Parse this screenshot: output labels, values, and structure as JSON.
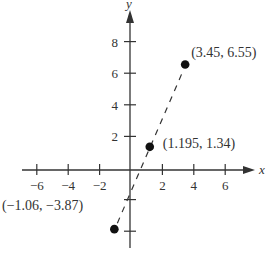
{
  "chart_data": {
    "type": "scatter",
    "title": "",
    "xlabel": "x",
    "ylabel": "y",
    "xlim": [
      -7,
      7.8
    ],
    "ylim": [
      -5,
      10
    ],
    "grid": false,
    "x_ticks": [
      -6,
      -4,
      -2,
      2,
      4,
      6
    ],
    "y_ticks": [
      -4,
      -2,
      2,
      4,
      6,
      8
    ],
    "y_tick_labels": [
      "",
      "",
      "2",
      "4",
      "6",
      "8"
    ],
    "x_tick_labels": [
      "−6",
      "−4",
      "−2",
      "2",
      "4",
      "6"
    ],
    "points": [
      {
        "x": -1.06,
        "y": -3.87,
        "label": "(−1.06, −3.87)"
      },
      {
        "x": 1.195,
        "y": 1.34,
        "label": "(1.195, 1.34)"
      },
      {
        "x": 3.45,
        "y": 6.55,
        "label": "(3.45, 6.55)"
      }
    ],
    "line": {
      "style": "dashed",
      "through": "points"
    },
    "colors": {
      "axis": "#333333",
      "points": "#111111",
      "line": "#333333"
    }
  }
}
